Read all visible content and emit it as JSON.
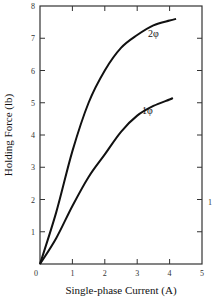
{
  "chart_data": {
    "type": "line",
    "title": "",
    "xlabel": "Single-phase Current (A)",
    "ylabel": "Holding Force (lb)",
    "xlim": [
      0,
      5
    ],
    "ylim": [
      0,
      8
    ],
    "xticks": [
      "0",
      "1",
      "2",
      "3",
      "4",
      "5"
    ],
    "yticks": [
      "1",
      "2",
      "3",
      "4",
      "5",
      "6",
      "7",
      "8"
    ],
    "grid": false,
    "legend": "inline labels at curve ends",
    "series": [
      {
        "name": "2φ",
        "x": [
          0,
          0.5,
          1,
          1.5,
          2,
          2.5,
          3,
          3.5,
          4,
          4.2
        ],
        "y": [
          0,
          1.6,
          3.5,
          5.0,
          6.0,
          6.7,
          7.1,
          7.4,
          7.55,
          7.6
        ]
      },
      {
        "name": "1φ",
        "x": [
          0,
          0.5,
          1,
          1.5,
          2,
          2.5,
          3,
          3.5,
          4,
          4.1
        ],
        "y": [
          0,
          0.8,
          1.8,
          2.7,
          3.4,
          4.1,
          4.6,
          4.9,
          5.1,
          5.15
        ]
      }
    ],
    "annotations": [
      {
        "text": "2φ",
        "near": "end of upper curve"
      },
      {
        "text": "1φ",
        "near": "end of lower curve"
      },
      {
        "text": "1",
        "near": "right margin, cropped label"
      }
    ]
  },
  "labels": {
    "x_origin": "0",
    "right_margin_fragment": "1"
  }
}
